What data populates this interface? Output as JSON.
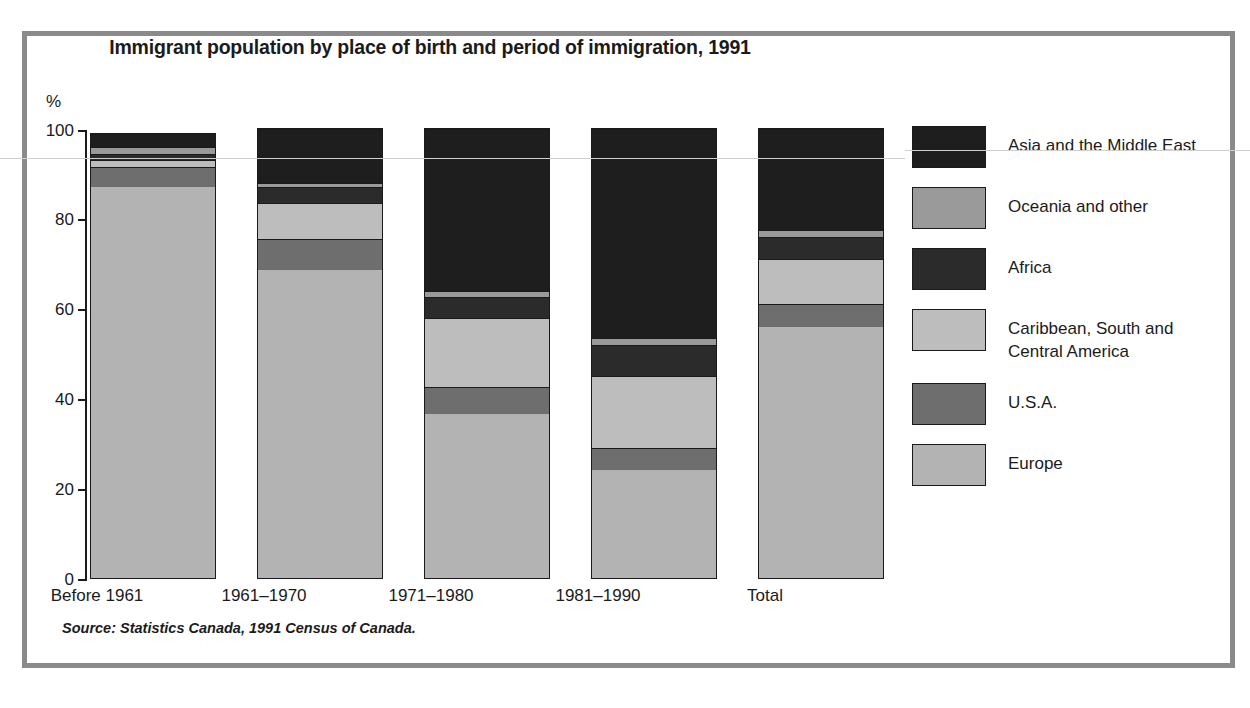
{
  "chart_data": {
    "type": "bar",
    "subtype": "stacked-percentage",
    "title": "Immigrant population by place of birth and period of immigration, 1991",
    "xlabel": "",
    "ylabel": "%",
    "ylim": [
      0,
      100
    ],
    "yticks": [
      0,
      20,
      40,
      60,
      80,
      100
    ],
    "ytick_labels": [
      "0",
      "20",
      "40",
      "60",
      "80",
      "100"
    ],
    "grid": false,
    "legend_position": "right",
    "categories": [
      "Before 1961",
      "1961–1970",
      "1971–1980",
      "1981–1990",
      "Total"
    ],
    "series": [
      {
        "name": "Europe",
        "color": "#b3b3b3",
        "values": [
          87.0,
          68.5,
          36.5,
          24.0,
          56.0
        ]
      },
      {
        "name": "U.S.A.",
        "color": "#6e6e6e",
        "values": [
          4.5,
          7.0,
          6.0,
          5.0,
          5.0
        ]
      },
      {
        "name": "Caribbean, South and Central America",
        "color": "#bdbdbd",
        "values": [
          1.5,
          8.0,
          15.5,
          16.0,
          10.0
        ]
      },
      {
        "name": "Africa",
        "color": "#2b2b2b",
        "values": [
          1.5,
          3.5,
          4.5,
          7.0,
          5.0
        ]
      },
      {
        "name": "Oceania and other",
        "color": "#9a9a9a",
        "values": [
          1.5,
          1.0,
          1.5,
          1.5,
          1.5
        ]
      },
      {
        "name": "Asia and the Middle East",
        "color": "#1e1e1e",
        "values": [
          3.0,
          12.0,
          36.0,
          46.5,
          22.5
        ]
      }
    ],
    "legend_order": [
      "Asia and the Middle East",
      "Oceania and other",
      "Africa",
      "Caribbean, South and Central America",
      "U.S.A.",
      "Europe"
    ],
    "source": "Source: Statistics Canada, 1991 Census of Canada."
  },
  "legend": {
    "items": [
      {
        "label": "Asia and the Middle East",
        "color": "#1e1e1e"
      },
      {
        "label": "Oceania and other",
        "color": "#9a9a9a"
      },
      {
        "label": "Africa",
        "color": "#2b2b2b"
      },
      {
        "label": "Caribbean, South and\nCentral America",
        "color": "#bdbdbd"
      },
      {
        "label": "U.S.A.",
        "color": "#6e6e6e"
      },
      {
        "label": "Europe",
        "color": "#b3b3b3"
      }
    ]
  },
  "axis": {
    "percent_symbol": "%",
    "y_labels": [
      "100",
      "80",
      "60",
      "40",
      "20",
      "0"
    ],
    "x_labels": [
      "Before 1961",
      "1961–1970",
      "1971–1980",
      "1981–1990",
      "Total"
    ]
  },
  "colors": {
    "frame": "#8a8a8a",
    "outline": "#1a1a1a",
    "text": "#1b1b1b"
  }
}
